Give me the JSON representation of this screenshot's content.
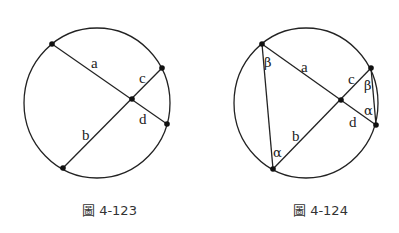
{
  "figures": [
    {
      "caption": "圖 4-123",
      "segment_labels": {
        "a": "a",
        "b": "b",
        "c": "c",
        "d": "d"
      }
    },
    {
      "caption": "圖 4-124",
      "segment_labels": {
        "a": "a",
        "b": "b",
        "c": "c",
        "d": "d"
      },
      "angle_labels": {
        "beta_left": "β",
        "alpha_left": "α",
        "beta_right": "β",
        "alpha_right": "α"
      }
    }
  ]
}
